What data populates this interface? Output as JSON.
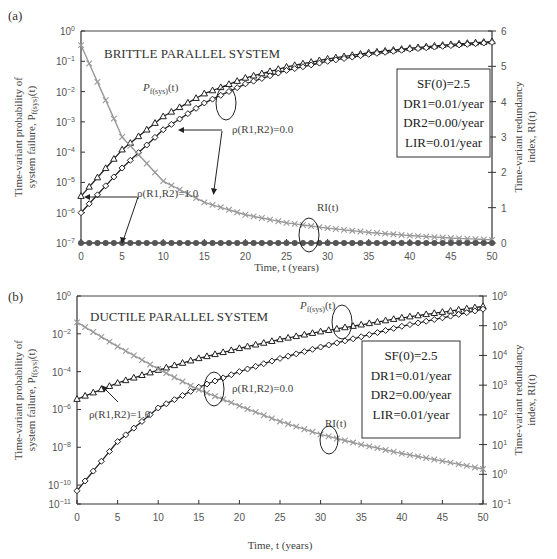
{
  "figure": {
    "panels": [
      {
        "label": "(a)",
        "title": "BRITTLE PARALLEL SYSTEM",
        "left_ylabel_line1": "Time-variant probability of",
        "left_ylabel_line2": "system failure, P",
        "left_ylabel_sub": "f(sys)",
        "left_ylabel_tail": "(t)",
        "right_ylabel_line1": "Time-variant redundancy",
        "right_ylabel_line2": "index, RI(t)",
        "xlabel": "Time, t (years)",
        "annotations": {
          "pf": "P",
          "pf_sub": "f(sys)",
          "pf_tail": "(t)",
          "rho0": "ρ(R1,R2)=0.0",
          "rho1": "ρ(R1,R2)=1.0",
          "ri": "RI(t)"
        },
        "params_box": [
          "SF(0)=2.5",
          "DR1=0.01/year",
          "DR2=0.00/year",
          "LIR=0.01/year"
        ]
      },
      {
        "label": "(b)",
        "title": "DUCTILE PARALLEL SYSTEM",
        "left_ylabel_line1": "Time-variant probability of",
        "left_ylabel_line2": "system failure, P",
        "left_ylabel_sub": "f(sys)",
        "left_ylabel_tail": "(t)",
        "right_ylabel_line1": "Time-variant redundancy",
        "right_ylabel_line2": "index, RI(t)",
        "xlabel": "Time, t (years)",
        "annotations": {
          "pf": "P",
          "pf_sub": "f(sys)",
          "pf_tail": "(t)",
          "rho0": "ρ(R1,R2)=0.0",
          "rho1": "ρ(R1,R2)=1.0",
          "ri": "RI(t)"
        },
        "params_box": [
          "SF(0)=2.5",
          "DR1=0.01/year",
          "DR2=0.00/year",
          "LIR=0.01/year"
        ]
      }
    ]
  },
  "chart_data": [
    {
      "type": "line",
      "title": "BRITTLE PARALLEL SYSTEM",
      "panel": "(a)",
      "xlabel": "Time, t (years)",
      "ylabel": "Time-variant probability of system failure, Pf(sys)(t)",
      "y2label": "Time-variant redundancy index, RI(t)",
      "xlim": [
        0,
        50
      ],
      "ylim": [
        1e-07,
        1
      ],
      "yscale": "log",
      "y2lim": [
        0,
        6
      ],
      "y2scale": "linear",
      "xticks": [
        0,
        5,
        10,
        15,
        20,
        25,
        30,
        35,
        40,
        45,
        50
      ],
      "yticks": [
        "10^0",
        "10^-1",
        "10^-2",
        "10^-3",
        "10^-4",
        "10^-5",
        "10^-6",
        "10^-7"
      ],
      "y2ticks": [
        0,
        1,
        2,
        3,
        4,
        5,
        6
      ],
      "grid": false,
      "x": [
        0,
        5,
        10,
        15,
        20,
        25,
        30,
        35,
        40,
        45,
        50
      ],
      "series": [
        {
          "name": "Pf(sys)(t), ρ(R1,R2)=1.0",
          "marker": "triangle",
          "axis": "left",
          "values": [
            3.5e-06,
            0.00012,
            0.0015,
            0.0085,
            0.028,
            0.065,
            0.12,
            0.19,
            0.27,
            0.36,
            0.45
          ]
        },
        {
          "name": "Pf(sys)(t), ρ(R1,R2)=0.0",
          "marker": "diamond",
          "axis": "left",
          "values": [
            1e-06,
            3e-05,
            0.00055,
            0.0042,
            0.018,
            0.05,
            0.1,
            0.17,
            0.25,
            0.33,
            0.42
          ]
        },
        {
          "name": "RI(t), ρ(R1,R2)=0.0",
          "marker": "x",
          "axis": "right",
          "color": "#999999",
          "values": [
            5.6,
            3.0,
            1.75,
            1.15,
            0.8,
            0.57,
            0.42,
            0.3,
            0.21,
            0.14,
            0.09
          ]
        },
        {
          "name": "RI(t), ρ(R1,R2)=1.0",
          "marker": "filled-circle",
          "axis": "right",
          "color": "#555555",
          "values": [
            0,
            0,
            0,
            0,
            0,
            0,
            0,
            0,
            0,
            0,
            0
          ]
        }
      ],
      "annotations": [
        "Pf(sys)(t)",
        "ρ(R1,R2)=0.0",
        "ρ(R1,R2)=1.0",
        "RI(t)",
        "SF(0)=2.5",
        "DR1=0.01/year",
        "DR2=0.00/year",
        "LIR=0.01/year"
      ]
    },
    {
      "type": "line",
      "title": "DUCTILE PARALLEL SYSTEM",
      "panel": "(b)",
      "xlabel": "Time, t (years)",
      "ylabel": "Time-variant probability of system failure, Pf(sys)(t)",
      "y2label": "Time-variant redundancy index, RI(t)",
      "xlim": [
        0,
        50
      ],
      "ylim": [
        1e-11,
        1
      ],
      "yscale": "log",
      "y2lim": [
        0.1,
        1000000.0
      ],
      "y2scale": "log",
      "xticks": [
        0,
        5,
        10,
        15,
        20,
        25,
        30,
        35,
        40,
        45,
        50
      ],
      "yticks": [
        "10^0",
        "10^-2",
        "10^-4",
        "10^-6",
        "10^-8",
        "10^-10",
        "10^-11"
      ],
      "y2ticks": [
        "10^6",
        "10^5",
        "10^4",
        "10^3",
        "10^2",
        "10^1",
        "10^0",
        "10^-1"
      ],
      "grid": false,
      "x": [
        0,
        5,
        10,
        15,
        20,
        25,
        30,
        35,
        40,
        45,
        50
      ],
      "series": [
        {
          "name": "Pf(sys)(t), ρ(R1,R2)=1.0",
          "marker": "triangle",
          "axis": "left",
          "values": [
            3.5e-06,
            2.5e-05,
            0.00012,
            0.0005,
            0.0017,
            0.005,
            0.013,
            0.03,
            0.07,
            0.14,
            0.28
          ]
        },
        {
          "name": "Pf(sys)(t), ρ(R1,R2)=0.0",
          "marker": "diamond",
          "axis": "left",
          "values": [
            5e-11,
            2e-08,
            1.2e-06,
            1.5e-05,
            0.0001,
            0.0005,
            0.002,
            0.007,
            0.025,
            0.07,
            0.2
          ]
        },
        {
          "name": "RI(t)",
          "marker": "x",
          "axis": "right",
          "color": "#999999",
          "values": [
            130000,
            20000,
            3500,
            700,
            200,
            60,
            22,
            10,
            5,
            2.8,
            1.5
          ]
        }
      ],
      "annotations": [
        "Pf(sys)(t)",
        "ρ(R1,R2)=0.0",
        "ρ(R1,R2)=1.0",
        "RI(t)",
        "SF(0)=2.5",
        "DR1=0.01/year",
        "DR2=0.00/year",
        "LIR=0.01/year"
      ]
    }
  ]
}
